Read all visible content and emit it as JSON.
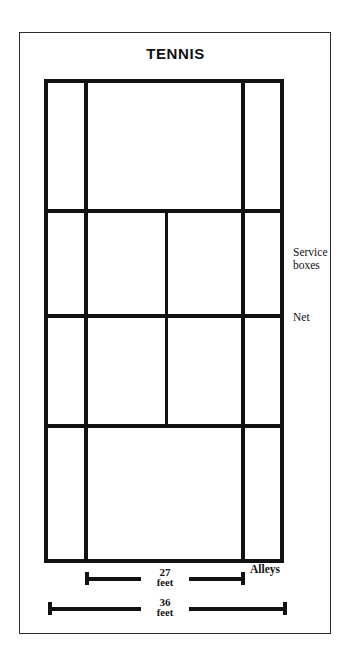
{
  "title": "TENNIS",
  "labels": {
    "service_boxes_line1": "Service",
    "service_boxes_line2": "boxes",
    "net": "Net",
    "alleys": "Alleys"
  },
  "dimensions": [
    {
      "id": "width-singles",
      "value": "27",
      "unit": "feet"
    },
    {
      "id": "width-doubles",
      "value": "36",
      "unit": "feet"
    }
  ],
  "colors": {
    "line": "#111111",
    "frame": "#2b2b2b",
    "background": "#ffffff"
  },
  "court": {
    "vertical_lines": [
      "left-doubles-sideline",
      "left-singles-sideline",
      "center-service-line",
      "right-singles-sideline",
      "right-doubles-sideline"
    ],
    "horizontal_lines": [
      "top-baseline",
      "top-service-line",
      "net-line",
      "bottom-service-line",
      "bottom-baseline"
    ]
  }
}
